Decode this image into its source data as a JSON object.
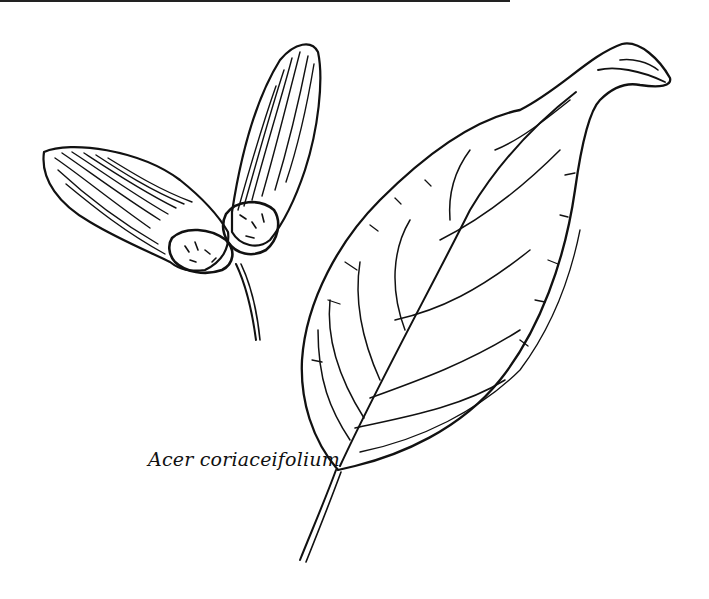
{
  "illustration": {
    "subjects": [
      "samara-fruit",
      "leaf"
    ],
    "caption": "Acer coriaceifolium"
  },
  "colors": {
    "ink": "#111111",
    "paper": "#ffffff"
  }
}
